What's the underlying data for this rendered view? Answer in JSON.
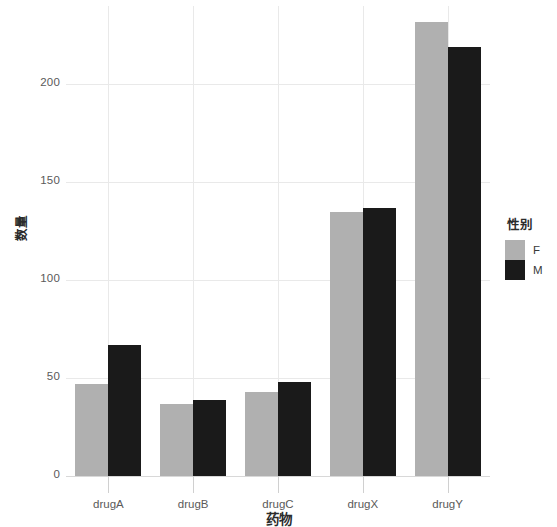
{
  "chart_data": {
    "type": "bar",
    "title": "",
    "subtitle": "",
    "categories": [
      "drugA",
      "drugB",
      "drugC",
      "drugX",
      "drugY"
    ],
    "series": [
      {
        "name": "F",
        "color": "#b0b0b0",
        "values": [
          47,
          37,
          43,
          135,
          232
        ]
      },
      {
        "name": "M",
        "color": "#1a1a1a",
        "values": [
          67,
          39,
          48,
          137,
          219
        ]
      }
    ],
    "xlabel": "药物",
    "ylabel": "数量",
    "ylim": [
      0,
      240
    ],
    "yticks": [
      0,
      50,
      100,
      150,
      200
    ],
    "ytick_labels": [
      "0",
      "50",
      "100",
      "150",
      "200"
    ],
    "grid": true,
    "grid_color": "#e9e9e9",
    "legend": {
      "title": "性别",
      "position": "right",
      "entries": [
        {
          "label": "F",
          "color": "#b0b0b0"
        },
        {
          "label": "M",
          "color": "#1a1a1a"
        }
      ]
    },
    "background": "#ffffff"
  }
}
